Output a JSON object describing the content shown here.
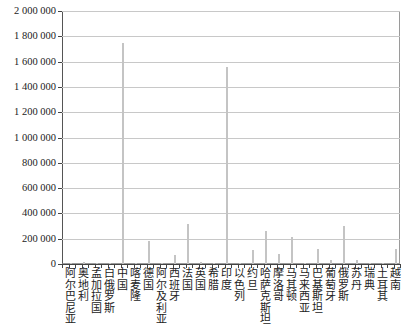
{
  "chart_data": {
    "type": "bar",
    "title": "",
    "xlabel": "",
    "ylabel": "",
    "ylim": [
      0,
      2000000
    ],
    "yticks": [
      "0",
      "200 000",
      "400 000",
      "600 000",
      "800 000",
      "1 000 000",
      "1 200 000",
      "1 400 000",
      "1 600 000",
      "1 800 000",
      "2 000 000"
    ],
    "grid": true,
    "legend": null,
    "categories": [
      "阿尔巴尼亚",
      "奥地利",
      "孟加拉国",
      "白俄罗斯",
      "中国",
      "喀麦隆",
      "德国",
      "阿尔及利亚",
      "西班牙",
      "法国",
      "英国",
      "希腊",
      "印度",
      "以色列",
      "约旦",
      "哈萨克斯坦",
      "摩洛哥",
      "马其顿",
      "马来西亚",
      "巴基斯坦",
      "葡萄牙",
      "俄罗斯",
      "苏丹",
      "瑞典",
      "土耳其",
      "越南"
    ],
    "values": [
      5000,
      15000,
      10000,
      8000,
      1750000,
      5000,
      180000,
      10000,
      70000,
      320000,
      15000,
      10000,
      1560000,
      5000,
      110000,
      260000,
      80000,
      210000,
      10000,
      115000,
      30000,
      300000,
      35000,
      5000,
      10000,
      120000
    ],
    "bar_color": "#c4c4c4"
  }
}
